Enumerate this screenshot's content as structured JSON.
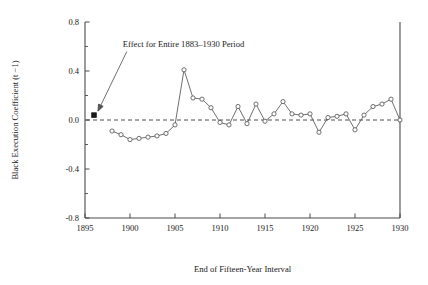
{
  "chart_data": {
    "type": "line",
    "title": "",
    "xlabel": "End of Fifteen-Year Interval",
    "ylabel": "Black Execution Coefficient (t −1)",
    "xlim": [
      1895,
      1930
    ],
    "ylim": [
      -0.8,
      0.8
    ],
    "grid": false,
    "legend": null,
    "x_ticks": [
      "1895",
      "1900",
      "1905",
      "1910",
      "1915",
      "1920",
      "1925",
      "1930"
    ],
    "x_tick_values": [
      1895,
      1900,
      1905,
      1910,
      1915,
      1920,
      1925,
      1930
    ],
    "y_ticks": [
      "0.8",
      "0.4",
      "0.0",
      "-0.4",
      "-0.8"
    ],
    "y_tick_values": [
      0.8,
      0.4,
      0.0,
      -0.4,
      -0.8
    ],
    "y_minor_ticks": [
      0.6,
      0.2,
      -0.2,
      -0.6
    ],
    "reference_lines": [
      {
        "name": "zero-line",
        "y": 0.0,
        "style": "dashed"
      }
    ],
    "annotations": [
      {
        "name": "entire-period-effect",
        "text": "Effect for Entire 1883–1930 Period",
        "text_x": 1899.2,
        "text_y": 0.6,
        "point_x": 1896.0,
        "point_y": 0.04,
        "marker": "filled-square"
      }
    ],
    "series": [
      {
        "name": "Black Execution Coefficient",
        "marker": "open-circle",
        "x": [
          1898,
          1899,
          1900,
          1901,
          1902,
          1903,
          1904,
          1905,
          1906,
          1907,
          1908,
          1909,
          1910,
          1911,
          1912,
          1913,
          1914,
          1915,
          1916,
          1917,
          1918,
          1919,
          1920,
          1921,
          1922,
          1923,
          1924,
          1925,
          1926,
          1927,
          1928,
          1929,
          1930
        ],
        "y": [
          -0.09,
          -0.12,
          -0.16,
          -0.15,
          -0.14,
          -0.13,
          -0.11,
          -0.04,
          0.41,
          0.18,
          0.17,
          0.1,
          -0.02,
          -0.04,
          0.11,
          -0.03,
          0.13,
          -0.01,
          0.05,
          0.15,
          0.05,
          0.04,
          0.05,
          -0.1,
          0.02,
          0.03,
          0.05,
          -0.08,
          0.04,
          0.11,
          0.13,
          0.17,
          0.0
        ]
      }
    ]
  }
}
